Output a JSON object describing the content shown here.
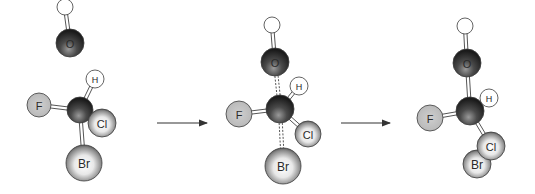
{
  "diagram": {
    "arrows": [
      {
        "x1": 157,
        "x2": 207,
        "y": 123
      },
      {
        "x1": 341,
        "x2": 390,
        "y": 123
      }
    ],
    "panels": [
      {
        "name": "reactants",
        "atoms": [
          {
            "id": "Ho",
            "label": "",
            "x": 65,
            "y": 7,
            "r": 8,
            "type": "H-plain"
          },
          {
            "id": "O",
            "label": "O",
            "x": 70,
            "y": 43,
            "r": 14,
            "type": "dark"
          },
          {
            "id": "C",
            "label": "",
            "x": 80,
            "y": 110,
            "r": 13,
            "type": "dark"
          },
          {
            "id": "H",
            "label": "H",
            "x": 95,
            "y": 79,
            "r": 9,
            "type": "H"
          },
          {
            "id": "F",
            "label": "F",
            "x": 39,
            "y": 105,
            "r": 12,
            "type": "F"
          },
          {
            "id": "Cl",
            "label": "Cl",
            "x": 102,
            "y": 123,
            "r": 14,
            "type": "light"
          },
          {
            "id": "Br",
            "label": "Br",
            "x": 84,
            "y": 163,
            "r": 18,
            "type": "light"
          }
        ],
        "bonds": [
          {
            "a": "Ho",
            "b": "O",
            "style": "solid"
          },
          {
            "a": "C",
            "b": "H",
            "style": "solid"
          },
          {
            "a": "C",
            "b": "F",
            "style": "solid"
          },
          {
            "a": "C",
            "b": "Cl",
            "style": "solid"
          },
          {
            "a": "C",
            "b": "Br",
            "style": "solid"
          }
        ]
      },
      {
        "name": "transition-state",
        "atoms": [
          {
            "id": "Ho",
            "label": "",
            "x": 272,
            "y": 25,
            "r": 8,
            "type": "H-plain"
          },
          {
            "id": "O",
            "label": "O",
            "x": 275,
            "y": 62,
            "r": 14,
            "type": "dark"
          },
          {
            "id": "C",
            "label": "",
            "x": 280,
            "y": 109,
            "r": 14,
            "type": "dark"
          },
          {
            "id": "H",
            "label": "H",
            "x": 299,
            "y": 86,
            "r": 9,
            "type": "H"
          },
          {
            "id": "F",
            "label": "F",
            "x": 239,
            "y": 114,
            "r": 13,
            "type": "F"
          },
          {
            "id": "Cl",
            "label": "Cl",
            "x": 308,
            "y": 134,
            "r": 13,
            "type": "light"
          },
          {
            "id": "Br",
            "label": "Br",
            "x": 283,
            "y": 166,
            "r": 18,
            "type": "light"
          }
        ],
        "bonds": [
          {
            "a": "Ho",
            "b": "O",
            "style": "solid"
          },
          {
            "a": "O",
            "b": "C",
            "style": "dashed"
          },
          {
            "a": "C",
            "b": "H",
            "style": "solid"
          },
          {
            "a": "C",
            "b": "F",
            "style": "solid"
          },
          {
            "a": "C",
            "b": "Cl",
            "style": "solid"
          },
          {
            "a": "C",
            "b": "Br",
            "style": "dashed"
          }
        ]
      },
      {
        "name": "products",
        "atoms": [
          {
            "id": "Ho",
            "label": "",
            "x": 465,
            "y": 26,
            "r": 8,
            "type": "H-plain"
          },
          {
            "id": "O",
            "label": "O",
            "x": 467,
            "y": 63,
            "r": 14,
            "type": "dark"
          },
          {
            "id": "C",
            "label": "",
            "x": 470,
            "y": 111,
            "r": 14,
            "type": "dark"
          },
          {
            "id": "H",
            "label": "H",
            "x": 489,
            "y": 98,
            "r": 9,
            "type": "H"
          },
          {
            "id": "F",
            "label": "F",
            "x": 430,
            "y": 118,
            "r": 13,
            "type": "F"
          },
          {
            "id": "Br",
            "label": "Br",
            "x": 477,
            "y": 164,
            "r": 14,
            "type": "light"
          },
          {
            "id": "Cl",
            "label": "Cl",
            "x": 491,
            "y": 146,
            "r": 14,
            "type": "light"
          }
        ],
        "bonds": [
          {
            "a": "Ho",
            "b": "O",
            "style": "solid"
          },
          {
            "a": "O",
            "b": "C",
            "style": "solid"
          },
          {
            "a": "C",
            "b": "H",
            "style": "solid"
          },
          {
            "a": "C",
            "b": "F",
            "style": "solid"
          },
          {
            "a": "C",
            "b": "Cl",
            "style": "solid"
          }
        ]
      }
    ],
    "colors": {
      "dark_hi": "#8a8a8a",
      "dark_lo": "#1e1e1e",
      "light_hi": "#ffffff",
      "light_lo": "#3a3a3a",
      "F_fill": "#c4c4c4",
      "H_fill": "#ffffff",
      "stroke": "#3c3c3c",
      "bond": "#555555",
      "arrow": "#333333",
      "label": "#2a2a2a"
    }
  }
}
